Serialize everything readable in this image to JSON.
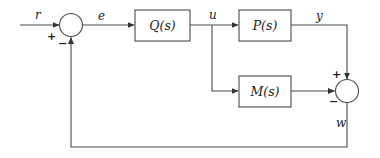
{
  "diagram": {
    "type": "block-diagram",
    "signals": {
      "input": "r",
      "error": "e",
      "control": "u",
      "output": "y",
      "feedback": "w"
    },
    "blocks": {
      "controller": "Q(s)",
      "plant": "P(s)",
      "model": "M(s)"
    },
    "junctions": {
      "sum1": {
        "plus": "+",
        "minus": "−"
      },
      "sum2": {
        "plus": "+",
        "minus": "−"
      }
    },
    "edges": [
      {
        "from": "r",
        "to": "sum1",
        "sign": "+"
      },
      {
        "from": "sum1",
        "to": "Q(s)",
        "label": "e"
      },
      {
        "from": "Q(s)",
        "to": "P(s)",
        "label": "u"
      },
      {
        "from": "Q(s)",
        "to": "M(s)",
        "label": "u"
      },
      {
        "from": "P(s)",
        "to": "sum2",
        "label": "y",
        "sign": "+"
      },
      {
        "from": "M(s)",
        "to": "sum2",
        "sign": "−"
      },
      {
        "from": "sum2",
        "to": "sum1",
        "label": "w",
        "sign": "−"
      }
    ]
  }
}
